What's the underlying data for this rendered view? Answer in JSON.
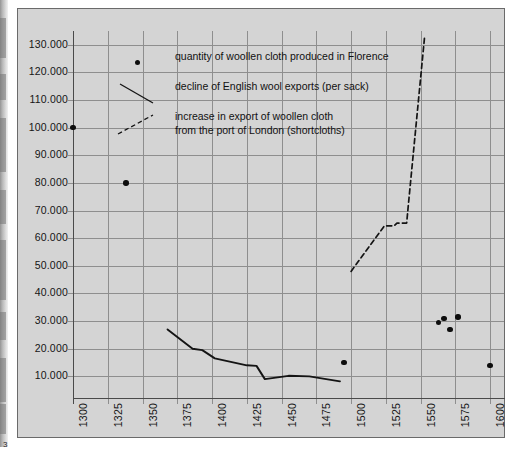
{
  "page": {
    "number": "3"
  },
  "chart_data": {
    "type": "scatter",
    "title": "",
    "subtitle": "",
    "xlabel": "",
    "ylabel": "",
    "xlim": [
      1300,
      1610
    ],
    "ylim": [
      0,
      135000
    ],
    "grid": true,
    "legend_position": "inside-top-left",
    "xticks": [
      "1300",
      "1325",
      "1350",
      "1375",
      "1400",
      "1425",
      "1450",
      "1475",
      "1500",
      "1525",
      "1550",
      "1575",
      "1600"
    ],
    "xtick_values": [
      1300,
      1325,
      1350,
      1375,
      1400,
      1425,
      1450,
      1475,
      1500,
      1525,
      1550,
      1575,
      1600
    ],
    "yticks": [
      "130.000",
      "120.000",
      "110.000",
      "100.000",
      "90.000",
      "80.000",
      "70.000",
      "60.000",
      "50.000",
      "40.000",
      "30.000",
      "20.000",
      "10.000"
    ],
    "ytick_values": [
      130000,
      120000,
      110000,
      100000,
      90000,
      80000,
      70000,
      60000,
      50000,
      40000,
      30000,
      20000,
      10000
    ],
    "series": [
      {
        "name": "quantity of woollen cloth  produced in Florence",
        "type": "scatter",
        "marker": "dot",
        "color": "#0d0d0d",
        "points": [
          {
            "x": 1300,
            "y": 100000
          },
          {
            "x": 1338,
            "y": 80000
          },
          {
            "x": 1495,
            "y": 15000
          },
          {
            "x": 1567,
            "y": 31000
          },
          {
            "x": 1563,
            "y": 29500
          },
          {
            "x": 1577,
            "y": 31500
          },
          {
            "x": 1571,
            "y": 27000
          },
          {
            "x": 1600,
            "y": 14000
          }
        ]
      },
      {
        "name": "decline of English wool exports (per sack)",
        "type": "line",
        "style": "solid",
        "color": "#141414",
        "points": [
          {
            "x": 1368,
            "y": 27000
          },
          {
            "x": 1386,
            "y": 20000
          },
          {
            "x": 1393,
            "y": 19500
          },
          {
            "x": 1402,
            "y": 16500
          },
          {
            "x": 1425,
            "y": 14000
          },
          {
            "x": 1432,
            "y": 13800
          },
          {
            "x": 1438,
            "y": 9000
          },
          {
            "x": 1455,
            "y": 10200
          },
          {
            "x": 1470,
            "y": 10000
          },
          {
            "x": 1492,
            "y": 8200
          }
        ]
      },
      {
        "name": "increase in export of  woollen cloth\nfrom the port of London (shortcloths)",
        "type": "line",
        "style": "dashed",
        "color": "#141414",
        "points": [
          {
            "x": 1500,
            "y": 48000
          },
          {
            "x": 1524,
            "y": 64500
          },
          {
            "x": 1531,
            "y": 64500
          },
          {
            "x": 1533,
            "y": 65500
          },
          {
            "x": 1540,
            "y": 65500
          },
          {
            "x": 1541,
            "y": 71000
          },
          {
            "x": 1553,
            "y": 133500
          }
        ]
      }
    ],
    "legend": [
      {
        "marker": "dot",
        "label": "quantity of woollen cloth  produced in Florence"
      },
      {
        "marker": "solid-line-down",
        "label": "decline of English wool exports (per sack)"
      },
      {
        "marker": "dashed-line-up",
        "label": "increase in export of  woollen cloth\nfrom the port of London (shortcloths)"
      }
    ],
    "colors": {
      "panel_background": "#d4d4d4",
      "gridline": "#8e8e8e",
      "axis": "#4a4a4a",
      "data": "#0d0d0d",
      "border": "#6a6a6a"
    }
  }
}
